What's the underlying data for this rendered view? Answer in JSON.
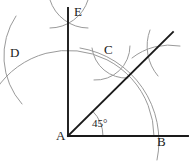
{
  "figure": {
    "kind": "compass-and-straightedge-construction",
    "canvas": {
      "width": 190,
      "height": 162,
      "background": "#ffffff"
    },
    "colors": {
      "heavy_stroke": "#1a1a1a",
      "light_stroke": "#9a9a9a",
      "label_text": "#1a1a1a",
      "background": "#ffffff"
    },
    "points": [
      {
        "id": "A",
        "label": "A",
        "x": 68,
        "y": 136,
        "label_x": 56,
        "label_y": 130
      },
      {
        "id": "B",
        "label": "B",
        "x": 153,
        "y": 136,
        "label_x": 157,
        "label_y": 136
      },
      {
        "id": "C",
        "label": "C",
        "x": 110,
        "y": 62,
        "label_x": 104,
        "label_y": 44
      },
      {
        "id": "D",
        "label": "D",
        "x": 30,
        "y": 57,
        "label_x": 10,
        "label_y": 47
      },
      {
        "id": "E",
        "label": "E",
        "x": 68,
        "y": 13,
        "label_x": 74,
        "label_y": 6
      }
    ],
    "angle": {
      "label": "45°",
      "value": 45,
      "unit": "degrees",
      "vertex": "A",
      "label_x": 92,
      "label_y": 120,
      "arc_radius": 35
    },
    "lines": [
      {
        "name": "ray-AB-horizontal",
        "from": [
          68,
          136
        ],
        "to": [
          188,
          136
        ],
        "weight": "heavy"
      },
      {
        "name": "ray-AE-vertical",
        "from": [
          68,
          136
        ],
        "to": [
          68,
          8
        ],
        "weight": "heavy"
      },
      {
        "name": "ray-bisector-AC",
        "from": [
          68,
          136
        ],
        "to": [
          173,
          32
        ],
        "weight": "heavy"
      }
    ],
    "arcs": [
      {
        "name": "main-arc-centered-at-A",
        "center": [
          68,
          136
        ],
        "radius": 86,
        "start_deg": 0,
        "end_deg": 168,
        "weight": "light"
      },
      {
        "name": "angle-arc-45",
        "center": [
          68,
          136
        ],
        "radius": 35,
        "start_deg": 0,
        "end_deg": 45,
        "weight": "light"
      },
      {
        "name": "arc-from-D-upper",
        "center": [
          30,
          57
        ],
        "radius": 40,
        "start_deg": -62,
        "end_deg": 62,
        "weight": "light"
      },
      {
        "name": "arc-from-B-upper",
        "center": [
          153,
          136
        ],
        "radius": 88,
        "start_deg": 96,
        "end_deg": 172,
        "weight": "light"
      },
      {
        "name": "cross-arc-E-left",
        "center": [
          68,
          13
        ],
        "radius": 26,
        "start_deg": 38,
        "end_deg": 142,
        "weight": "light"
      },
      {
        "name": "cross-arc-E-right",
        "center": [
          68,
          13
        ],
        "radius": 26,
        "start_deg": 218,
        "end_deg": 322,
        "weight": "light"
      },
      {
        "name": "cross-arc-C-left",
        "center": [
          110,
          62
        ],
        "radius": 24,
        "start_deg": 30,
        "end_deg": 150,
        "weight": "light"
      },
      {
        "name": "cross-arc-C-right",
        "center": [
          110,
          62
        ],
        "radius": 24,
        "start_deg": 210,
        "end_deg": 330,
        "weight": "light"
      },
      {
        "name": "cross-arc-right-vertical",
        "center": [
          155,
          52
        ],
        "radius": 24,
        "start_deg": 255,
        "end_deg": 285,
        "weight": "light"
      },
      {
        "name": "cross-arc-right-horizontal",
        "center": [
          155,
          52
        ],
        "radius": 28,
        "start_deg": 350,
        "end_deg": 190,
        "weight": "light"
      },
      {
        "name": "tick-arc-at-D",
        "center": [
          30,
          57
        ],
        "radius": 22,
        "start_deg": 260,
        "end_deg": 280,
        "weight": "light"
      }
    ]
  }
}
